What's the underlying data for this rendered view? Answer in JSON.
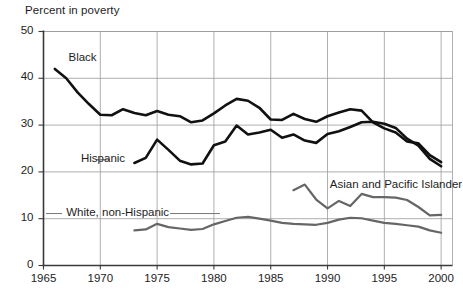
{
  "chart_data": {
    "type": "line",
    "title": "Percent in poverty",
    "xlabel": "",
    "ylabel": "Percent in poverty",
    "xlim": [
      1965,
      2001
    ],
    "ylim": [
      0,
      50
    ],
    "grid": true,
    "legend_position": "inline-annotations",
    "xticks": [
      "1965",
      "1970",
      "1975",
      "1980",
      "1985",
      "1990",
      "1995",
      "2000"
    ],
    "xtick_values": [
      1965,
      1970,
      1975,
      1980,
      1985,
      1990,
      1995,
      2000
    ],
    "yticks": [
      "0",
      "10",
      "20",
      "30",
      "40",
      "50"
    ],
    "ytick_values": [
      0,
      10,
      20,
      30,
      40,
      50
    ],
    "series": [
      {
        "name": "Black",
        "color": "#111111",
        "width": 2.6,
        "label_x": 1967.2,
        "label_y": 44.2,
        "x": [
          1966,
          1967,
          1968,
          1969,
          1970,
          1971,
          1972,
          1973,
          1974,
          1975,
          1976,
          1977,
          1978,
          1979,
          1980,
          1981,
          1982,
          1983,
          1984,
          1985,
          1986,
          1987,
          1988,
          1989,
          1990,
          1991,
          1992,
          1993,
          1994,
          1995,
          1996,
          1997,
          1998,
          1999,
          2000
        ],
        "y": [
          42.0,
          40.0,
          37.0,
          34.5,
          32.2,
          32.1,
          33.4,
          32.6,
          32.1,
          33.0,
          32.2,
          31.9,
          30.6,
          31.0,
          32.5,
          34.2,
          35.6,
          35.2,
          33.7,
          31.2,
          31.1,
          32.4,
          31.3,
          30.7,
          31.9,
          32.7,
          33.4,
          33.1,
          30.6,
          29.3,
          28.4,
          26.5,
          26.1,
          23.6,
          22.1
        ]
      },
      {
        "name": "Hispanic",
        "color": "#111111",
        "width": 2.6,
        "label_x": 1968.3,
        "label_y": 22.6,
        "x": [
          1973,
          1974,
          1975,
          1976,
          1977,
          1978,
          1979,
          1980,
          1981,
          1982,
          1983,
          1984,
          1985,
          1986,
          1987,
          1988,
          1989,
          1990,
          1991,
          1992,
          1993,
          1994,
          1995,
          1996,
          1997,
          1998,
          1999,
          2000
        ],
        "y": [
          21.9,
          23.0,
          26.9,
          24.7,
          22.4,
          21.6,
          21.8,
          25.7,
          26.5,
          29.9,
          28.0,
          28.4,
          29.0,
          27.3,
          28.0,
          26.7,
          26.2,
          28.1,
          28.7,
          29.6,
          30.6,
          30.7,
          30.3,
          29.4,
          27.1,
          25.6,
          22.8,
          21.2
        ]
      },
      {
        "name": "Asian and Pacific Islander",
        "color": "#666666",
        "width": 2.2,
        "label_x": 1990.2,
        "label_y": 17.0,
        "x": [
          1987,
          1988,
          1989,
          1990,
          1991,
          1992,
          1993,
          1994,
          1995,
          1996,
          1997,
          1998,
          1999,
          2000
        ],
        "y": [
          16.1,
          17.3,
          14.1,
          12.2,
          13.8,
          12.7,
          15.3,
          14.6,
          14.6,
          14.5,
          14.0,
          12.5,
          10.7,
          10.8
        ]
      },
      {
        "name": "White, non-Hispanic",
        "color": "#666666",
        "width": 2.2,
        "label_x": 1967.0,
        "label_y": 11.1,
        "x": [
          1973,
          1974,
          1975,
          1976,
          1977,
          1978,
          1979,
          1980,
          1981,
          1982,
          1983,
          1984,
          1985,
          1986,
          1987,
          1988,
          1989,
          1990,
          1991,
          1992,
          1993,
          1994,
          1995,
          1996,
          1997,
          1998,
          1999,
          2000
        ],
        "y": [
          7.5,
          7.7,
          8.9,
          8.2,
          7.9,
          7.6,
          7.8,
          8.8,
          9.5,
          10.2,
          10.4,
          10.0,
          9.6,
          9.1,
          8.9,
          8.8,
          8.7,
          9.1,
          9.8,
          10.2,
          10.1,
          9.6,
          9.1,
          8.9,
          8.6,
          8.3,
          7.5,
          7.0
        ]
      }
    ]
  }
}
